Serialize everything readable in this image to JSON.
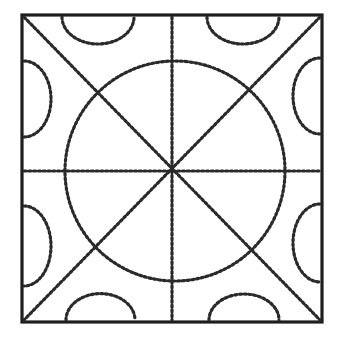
{
  "figure": {
    "colors": {
      "ink": "#2a2a2a",
      "frame": "#1e1e1e",
      "background": "#ffffff"
    },
    "square": {
      "x": 22,
      "y": 15,
      "size": 300
    },
    "circle": {
      "cx": 175,
      "cy": 171,
      "r": 110
    },
    "lines": [
      {
        "name": "vertical",
        "x1": 172,
        "y1": 17,
        "x2": 172,
        "y2": 320
      },
      {
        "name": "horizontal",
        "x1": 24,
        "y1": 171,
        "x2": 320,
        "y2": 171
      },
      {
        "name": "diagonal-main",
        "x1": 24,
        "y1": 17,
        "x2": 320,
        "y2": 320
      },
      {
        "name": "diagonal-anti",
        "x1": 320,
        "y1": 17,
        "x2": 24,
        "y2": 320
      }
    ],
    "edge_semicircles": [
      {
        "edge": "top",
        "position": "left",
        "cx": 98,
        "cy": 15,
        "r": 36
      },
      {
        "edge": "top",
        "position": "right",
        "cx": 243,
        "cy": 15,
        "r": 36
      },
      {
        "edge": "bottom",
        "position": "left",
        "cx": 100,
        "cy": 322,
        "r": 35
      },
      {
        "edge": "bottom",
        "position": "right",
        "cx": 244,
        "cy": 322,
        "r": 35
      },
      {
        "edge": "left",
        "position": "top",
        "cx": 22,
        "cy": 98,
        "r": 38
      },
      {
        "edge": "left",
        "position": "bottom",
        "cx": 22,
        "cy": 245,
        "r": 40
      },
      {
        "edge": "right",
        "position": "top",
        "cx": 322,
        "cy": 96,
        "r": 38
      },
      {
        "edge": "right",
        "position": "bottom",
        "cx": 322,
        "cy": 243,
        "r": 38
      }
    ]
  }
}
